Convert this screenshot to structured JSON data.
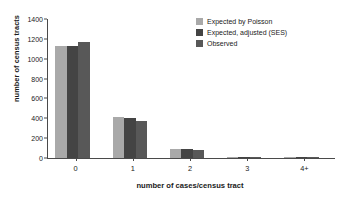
{
  "chart_data": {
    "type": "bar",
    "title": "",
    "xlabel": "number of cases/census tract",
    "ylabel": "number of census tracts",
    "categories": [
      "0",
      "1",
      "2",
      "3",
      "4+"
    ],
    "ylim": [
      0,
      1400
    ],
    "yticks": [
      0,
      200,
      400,
      600,
      800,
      1000,
      1200,
      1400
    ],
    "grid": false,
    "legend_position": "top-right",
    "series": [
      {
        "name": "Expected by Poisson",
        "color": "#a9a9a9",
        "values": [
          1125,
          415,
          90,
          12,
          2
        ]
      },
      {
        "name": "Expected, adjusted (SES)",
        "color": "#444444",
        "values": [
          1125,
          408,
          88,
          14,
          2
        ]
      },
      {
        "name": "Observed",
        "color": "#585858",
        "values": [
          1165,
          372,
          85,
          10,
          2
        ]
      }
    ]
  },
  "legend": {
    "items": [
      {
        "label": "Expected by Poisson",
        "color": "#a9a9a9"
      },
      {
        "label": "Expected, adjusted (SES)",
        "color": "#444444"
      },
      {
        "label": "Observed",
        "color": "#585858"
      }
    ]
  }
}
